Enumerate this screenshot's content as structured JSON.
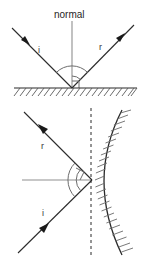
{
  "figure": {
    "background_color": "#ffffff",
    "width": 145,
    "height": 260,
    "colors": {
      "ray": "#2b2b2b",
      "normal": "#8f8f8f",
      "arc": "#6d6d6d",
      "surface": "#2b2b2b",
      "hatch": "#5a5a5a",
      "label": "#3a3a3a",
      "dashed": "#2b2b2b"
    }
  },
  "top_diagram": {
    "name": "plane-mirror-reflection",
    "normal_label": "normal",
    "incident_ray_label": "i",
    "reflected_ray_label": "r",
    "surface_type": "plane",
    "normal_orientation": "vertical",
    "reflection_point": {
      "x": 72,
      "y": 88
    },
    "incident_start": {
      "x": 12,
      "y": 28
    },
    "reflected_end": {
      "x": 134,
      "y": 25
    },
    "incident_arrow": {
      "x": 26,
      "y": 41
    },
    "reflected_arrow": {
      "x": 120,
      "y": 38
    },
    "normal_top": {
      "x": 72,
      "y": 20
    },
    "angle_arc_radius": 22,
    "right_angle_marker": true
  },
  "bottom_diagram": {
    "name": "curved-mirror-reflection",
    "incident_ray_label": "i",
    "reflected_ray_label": "r",
    "surface_type": "curved",
    "normal_orientation": "horizontal",
    "normal_is_dashed_tangent": true,
    "reflection_point": {
      "x": 92,
      "y": 180
    },
    "incident_start": {
      "x": 18,
      "y": 253
    },
    "reflected_end": {
      "x": 24,
      "y": 112
    },
    "incident_arrow": {
      "x": 44,
      "y": 228
    },
    "reflected_arrow": {
      "x": 43,
      "y": 129
    },
    "normal_left": {
      "x": 22,
      "y": 180
    },
    "dashed_line_x": 91,
    "dashed_top": 108,
    "dashed_bottom": 256,
    "angle_arc_radius": 24,
    "right_angle_marker": true
  },
  "labels": {
    "normal": "normal",
    "incident": "i",
    "reflected": "r"
  }
}
